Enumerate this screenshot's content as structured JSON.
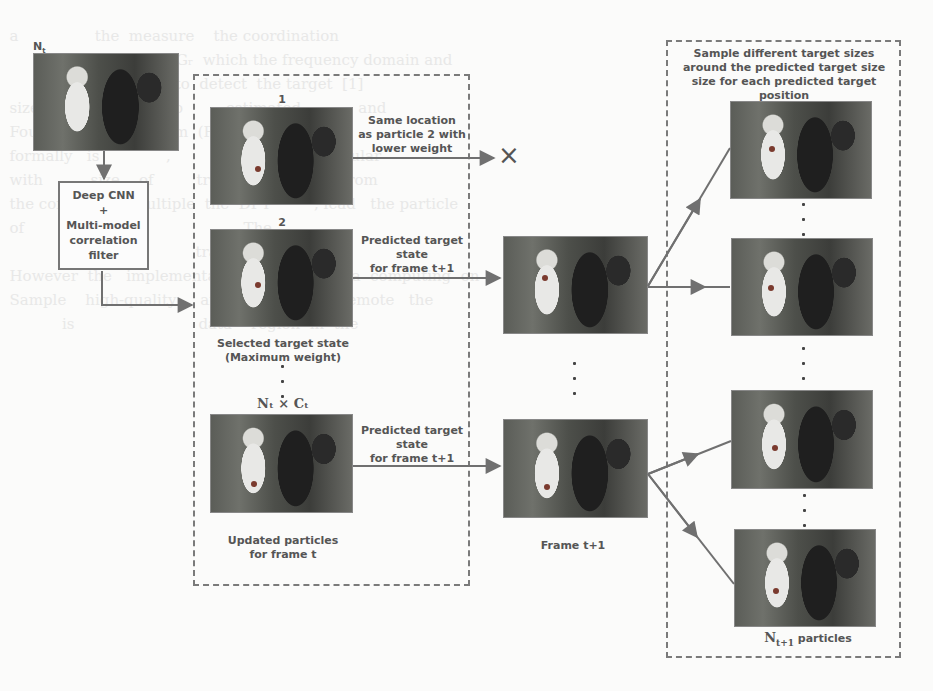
{
  "figure": {
    "input_label_base": "N",
    "input_label_sub": "t",
    "input_label_suffix": " particles",
    "cnn_box": {
      "line1": "Deep CNN",
      "line2": "+",
      "line3": "Multi-model",
      "line4": "correlation",
      "line5": "filter"
    },
    "middle_panel": {
      "particle_1_index": "1",
      "particle_2_index": "2",
      "selected_line1": "Selected target state",
      "selected_line2": "(Maximum weight)",
      "count_label": "Nₜ × Cₜ",
      "updated_line1": "Updated particles",
      "updated_line2": "for frame t"
    },
    "arrows": {
      "rejected_line1": "Same location",
      "rejected_line2": "as particle 2 with",
      "rejected_line3": "lower weight",
      "rejected_symbol": "×",
      "predicted_a_line1": "Predicted target",
      "predicted_a_line2": "state",
      "predicted_a_line3": "for frame t+1",
      "predicted_b_line1": "Predicted target",
      "predicted_b_line2": "state",
      "predicted_b_line3": "for frame t+1"
    },
    "frame_label": "Frame t+1",
    "right_panel": {
      "title_line1": "Sample different target sizes",
      "title_line2": "around the predicted target size",
      "title_line3": "size for each predicted target",
      "title_line4": "position",
      "output_label_base": "N",
      "output_label_sub": "t+1",
      "output_label_suffix": " particles"
    },
    "colors": {
      "arrow": "#707070",
      "dashed_border": "#7a7a7a",
      "text": "#555555",
      "background": "#fbfbfa"
    }
  }
}
